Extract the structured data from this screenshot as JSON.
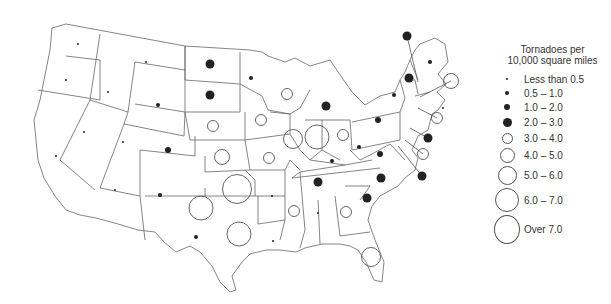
{
  "legend": {
    "title_line1": "Tornadoes per",
    "title_line2": "10,000 square miles",
    "items": [
      {
        "label": "Less than 0.5",
        "style": "filled",
        "size": 2
      },
      {
        "label": "0.5 – 1.0",
        "style": "filled",
        "size": 4
      },
      {
        "label": "1.0 – 2.0",
        "style": "filled",
        "size": 6
      },
      {
        "label": "2.0 – 3.0",
        "style": "filled",
        "size": 9
      },
      {
        "label": "3.0 – 4.0",
        "style": "open",
        "size": 11
      },
      {
        "label": "4.0 – 5.0",
        "style": "open",
        "size": 15
      },
      {
        "label": "5.0 – 6.0",
        "style": "open",
        "size": 19
      },
      {
        "label": "6.0 – 7.0",
        "style": "open",
        "size": 24
      },
      {
        "label": "Over 7.0",
        "style": "open",
        "size": 29
      }
    ]
  },
  "colors": {
    "ink": "#222222",
    "line": "#666666",
    "bg": "#ffffff"
  },
  "states": [
    {
      "name": "Washington",
      "category": "Less than 0.5",
      "x": 78,
      "y": 44
    },
    {
      "name": "Oregon",
      "category": "Less than 0.5",
      "x": 66,
      "y": 80
    },
    {
      "name": "California",
      "category": "Less than 0.5",
      "x": 56,
      "y": 156
    },
    {
      "name": "Nevada",
      "category": "Less than 0.5",
      "x": 84,
      "y": 132
    },
    {
      "name": "Idaho",
      "category": "Less than 0.5",
      "x": 108,
      "y": 92
    },
    {
      "name": "Montana",
      "category": "Less than 0.5",
      "x": 146,
      "y": 62
    },
    {
      "name": "Wyoming",
      "category": "0.5 – 1.0",
      "x": 158,
      "y": 105
    },
    {
      "name": "Utah",
      "category": "Less than 0.5",
      "x": 123,
      "y": 142
    },
    {
      "name": "Arizona",
      "category": "Less than 0.5",
      "x": 115,
      "y": 190
    },
    {
      "name": "Colorado",
      "category": "1.0 – 2.0",
      "x": 168,
      "y": 150
    },
    {
      "name": "New Mexico",
      "category": "0.5 – 1.0",
      "x": 160,
      "y": 195
    },
    {
      "name": "North Dakota",
      "category": "2.0 – 3.0",
      "x": 210,
      "y": 64
    },
    {
      "name": "South Dakota",
      "category": "2.0 – 3.0",
      "x": 210,
      "y": 95
    },
    {
      "name": "Nebraska",
      "category": "3.0 – 4.0",
      "x": 213,
      "y": 126
    },
    {
      "name": "Kansas",
      "category": "4.0 – 5.0",
      "x": 222,
      "y": 157
    },
    {
      "name": "Oklahoma",
      "category": "Over 7.0",
      "x": 237,
      "y": 189
    },
    {
      "name": "Texas",
      "category": "6.0 – 7.0",
      "x": 239,
      "y": 234
    },
    {
      "name": "Texas Panhandle",
      "category": "6.0 – 7.0",
      "x": 201,
      "y": 208
    },
    {
      "name": "Texas West",
      "category": "0.5 – 1.0",
      "x": 196,
      "y": 237
    },
    {
      "name": "Minnesota",
      "category": "0.5 – 1.0",
      "x": 251,
      "y": 78
    },
    {
      "name": "Iowa",
      "category": "3.0 – 4.0",
      "x": 261,
      "y": 120
    },
    {
      "name": "Missouri",
      "category": "3.0 – 4.0",
      "x": 269,
      "y": 158
    },
    {
      "name": "Arkansas",
      "category": "Less than 0.5",
      "x": 272,
      "y": 196
    },
    {
      "name": "Louisiana",
      "category": "Less than 0.5",
      "x": 273,
      "y": 241
    },
    {
      "name": "Wisconsin",
      "category": "3.0 – 4.0",
      "x": 287,
      "y": 94
    },
    {
      "name": "Illinois",
      "category": "5.0 – 6.0",
      "x": 293,
      "y": 139
    },
    {
      "name": "Indiana",
      "category": "6.0 – 7.0",
      "x": 317,
      "y": 137
    },
    {
      "name": "Michigan",
      "category": "2.0 – 3.0",
      "x": 326,
      "y": 106
    },
    {
      "name": "Ohio",
      "category": "3.0 – 4.0",
      "x": 343,
      "y": 135
    },
    {
      "name": "Kentucky",
      "category": "0.5 – 1.0",
      "x": 332,
      "y": 161
    },
    {
      "name": "Tennessee",
      "category": "2.0 – 3.0",
      "x": 318,
      "y": 182
    },
    {
      "name": "Mississippi",
      "category": "3.0 – 4.0",
      "x": 294,
      "y": 211
    },
    {
      "name": "Alabama",
      "category": "Less than 0.5",
      "x": 318,
      "y": 213
    },
    {
      "name": "Georgia",
      "category": "3.0 – 4.0",
      "x": 346,
      "y": 212
    },
    {
      "name": "Florida",
      "category": "5.0 – 6.0",
      "x": 371,
      "y": 257
    },
    {
      "name": "South Carolina",
      "category": "2.0 – 3.0",
      "x": 367,
      "y": 198
    },
    {
      "name": "North Carolina",
      "category": "2.0 – 3.0",
      "x": 381,
      "y": 178
    },
    {
      "name": "Virginia",
      "category": "1.0 – 2.0",
      "x": 380,
      "y": 154
    },
    {
      "name": "West Virginia",
      "category": "0.5 – 1.0",
      "x": 359,
      "y": 147
    },
    {
      "name": "Pennsylvania",
      "category": "1.0 – 2.0",
      "x": 378,
      "y": 120
    },
    {
      "name": "New York",
      "category": "0.5 – 1.0",
      "x": 394,
      "y": 95
    },
    {
      "name": "Vermont",
      "category": "2.0 – 3.0",
      "x": 409,
      "y": 78
    },
    {
      "name": "New Hampshire",
      "category": "2.0 – 3.0",
      "x": 407,
      "y": 36
    },
    {
      "name": "Maine",
      "category": "0.5 – 1.0",
      "x": 430,
      "y": 62
    },
    {
      "name": "Massachusetts",
      "category": "4.0 – 5.0",
      "x": 451,
      "y": 81
    },
    {
      "name": "Rhode Island",
      "category": "Less than 0.5",
      "x": 443,
      "y": 108
    },
    {
      "name": "Connecticut",
      "category": "3.0 – 4.0",
      "x": 437,
      "y": 118
    },
    {
      "name": "New Jersey",
      "category": "2.0 – 3.0",
      "x": 428,
      "y": 138
    },
    {
      "name": "Delaware",
      "category": "3.0 – 4.0",
      "x": 423,
      "y": 154
    },
    {
      "name": "Maryland",
      "category": "2.0 – 3.0",
      "x": 422,
      "y": 176
    }
  ]
}
